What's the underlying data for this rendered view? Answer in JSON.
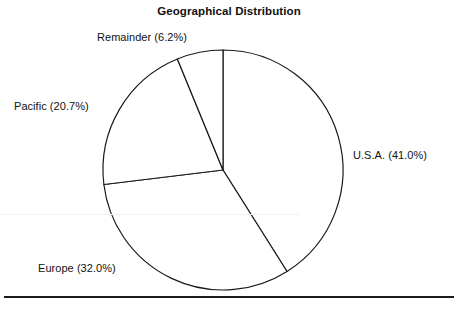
{
  "chart_data": {
    "type": "pie",
    "title": "Geographical Distribution",
    "xlabel": "",
    "ylabel": "",
    "categories": [
      "U.S.A.",
      "Europe",
      "Pacific",
      "Remainder"
    ],
    "values": [
      41.0,
      32.0,
      20.7,
      6.2
    ],
    "unit": "%",
    "labels": [
      "U.S.A. (41.0%)",
      "Europe (32.0%)",
      "Pacific (20.7%)",
      "Remainder (6.2%)"
    ],
    "slice_order": "clockwise from 12 o'clock",
    "start_angle_deg": 0,
    "legend": "none",
    "grid": false,
    "colors": {
      "slice_fill": "#ffffff",
      "slice_outline": "#1a1a1a",
      "text": "#121212",
      "background": "#ffffff"
    },
    "geometry": {
      "center_x": 223,
      "center_y": 170,
      "radius": 120
    }
  },
  "figure": {
    "title": "Geographical Distribution",
    "labels": {
      "usa": "U.S.A. (41.0%)",
      "europe": "Europe (32.0%)",
      "pacific": "Pacific (20.7%)",
      "remainder": "Remainder (6.2%)"
    }
  }
}
